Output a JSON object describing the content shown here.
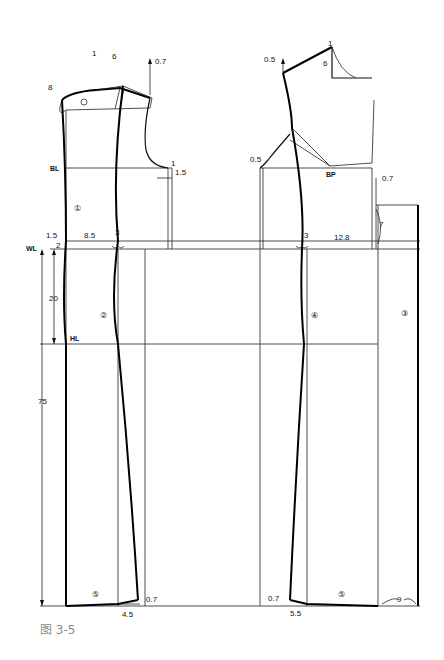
{
  "figure": {
    "caption": "图 3-5",
    "type": "garment pattern draft (front and back bodice with skirt extension)"
  },
  "reference_lines": {
    "bust_line": "BL",
    "waist_line": "WL",
    "hip_line": "HL"
  },
  "dimensions": {
    "waist_to_hip": "20",
    "total_length": "75"
  },
  "back_piece": {
    "labels": {
      "neck_rise": "1",
      "shoulder_dart": "6",
      "shoulder_raise": "0.7",
      "neck_curve": "8",
      "armhole_drop": "1",
      "armhole_out": "1.5",
      "center_back_in": "1.5",
      "waist_drop": "2",
      "waist_width": "8.5",
      "dart": "3",
      "hem_out": "0.7",
      "hem_width": "4.5"
    },
    "seam_markers": [
      "①",
      "②",
      "⑤"
    ]
  },
  "front_piece": {
    "labels": {
      "shoulder_raise": "0.5",
      "neck_rise": "1",
      "neck_depth": "6",
      "armhole_in": "0.5",
      "bust_point": "BP",
      "side_raise": "0.7",
      "side_length": "7",
      "waist_width": "12.8",
      "dart": "3",
      "hem_in": "0.7",
      "hem_width": "5.5",
      "hem_extension": "9"
    },
    "seam_markers": [
      "④",
      "⑤",
      "③"
    ]
  }
}
